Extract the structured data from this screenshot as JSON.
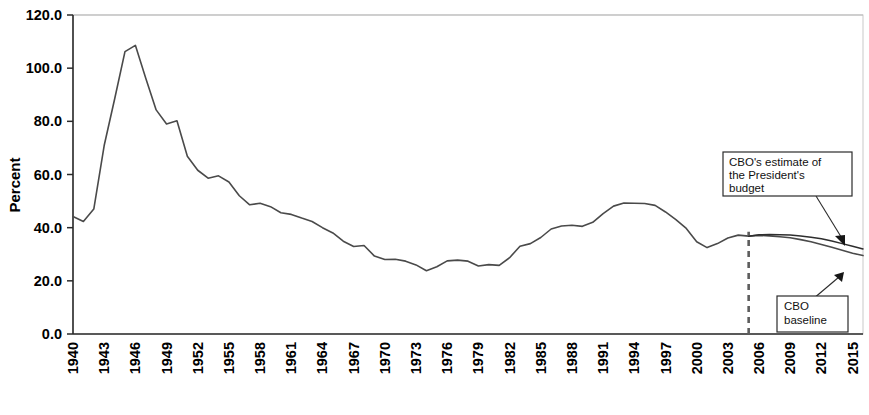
{
  "chart_data": {
    "type": "line",
    "title": "",
    "xlabel": "",
    "ylabel": "Percent",
    "ylim": [
      0.0,
      120.0
    ],
    "xlim": [
      1940,
      2016
    ],
    "yticks": [
      "0.0",
      "20.0",
      "40.0",
      "60.0",
      "80.0",
      "100.0",
      "120.0"
    ],
    "ytick_values": [
      0.0,
      20.0,
      40.0,
      60.0,
      80.0,
      100.0,
      120.0
    ],
    "xticks": [
      "1940",
      "1943",
      "1946",
      "1949",
      "1952",
      "1955",
      "1958",
      "1961",
      "1964",
      "1967",
      "1970",
      "1973",
      "1976",
      "1979",
      "1982",
      "1985",
      "1988",
      "1991",
      "1994",
      "1997",
      "2000",
      "2003",
      "2006",
      "2009",
      "2012",
      "2015"
    ],
    "xtick_values": [
      1940,
      1943,
      1946,
      1949,
      1952,
      1955,
      1958,
      1961,
      1964,
      1967,
      1970,
      1973,
      1976,
      1979,
      1982,
      1985,
      1988,
      1991,
      1994,
      1997,
      2000,
      2003,
      2006,
      2009,
      2012,
      2015
    ],
    "grid": false,
    "legend_position": "none",
    "projection_start_year": 2005,
    "series": [
      {
        "name": "Historical and CBO baseline",
        "color": "#4a4a4a",
        "x": [
          1940,
          1941,
          1942,
          1943,
          1944,
          1945,
          1946,
          1947,
          1948,
          1949,
          1950,
          1951,
          1952,
          1953,
          1954,
          1955,
          1956,
          1957,
          1958,
          1959,
          1960,
          1961,
          1962,
          1963,
          1964,
          1965,
          1966,
          1967,
          1968,
          1969,
          1970,
          1971,
          1972,
          1973,
          1974,
          1975,
          1976,
          1977,
          1978,
          1979,
          1980,
          1981,
          1982,
          1983,
          1984,
          1985,
          1986,
          1987,
          1988,
          1989,
          1990,
          1991,
          1992,
          1993,
          1994,
          1995,
          1996,
          1997,
          1998,
          1999,
          2000,
          2001,
          2002,
          2003,
          2004,
          2005,
          2006,
          2007,
          2008,
          2009,
          2010,
          2011,
          2012,
          2013,
          2014,
          2015,
          2016
        ],
        "y": [
          44.2,
          42.3,
          47.0,
          70.9,
          88.3,
          106.2,
          108.6,
          96.2,
          84.3,
          79.0,
          80.2,
          66.9,
          61.6,
          58.6,
          59.5,
          57.2,
          52.0,
          48.6,
          49.2,
          47.9,
          45.6,
          45.0,
          43.6,
          42.3,
          40.0,
          38.0,
          34.9,
          32.9,
          33.3,
          29.3,
          28.0,
          28.1,
          27.4,
          26.0,
          23.8,
          25.3,
          27.5,
          27.8,
          27.4,
          25.6,
          26.1,
          25.8,
          28.7,
          33.0,
          34.0,
          36.3,
          39.5,
          40.6,
          40.9,
          40.5,
          42.0,
          45.3,
          48.1,
          49.3,
          49.2,
          49.1,
          48.4,
          45.9,
          43.0,
          39.7,
          34.7,
          32.5,
          34.0,
          36.1,
          37.2,
          36.8,
          37.1,
          36.9,
          36.6,
          36.2,
          35.5,
          34.7,
          33.7,
          32.6,
          31.5,
          30.4,
          29.5
        ]
      },
      {
        "name": "CBO's estimate of the President's budget",
        "color": "#2e2e2e",
        "x": [
          2005,
          2006,
          2007,
          2008,
          2009,
          2010,
          2011,
          2012,
          2013,
          2014,
          2015,
          2016
        ],
        "y": [
          36.8,
          37.3,
          37.4,
          37.3,
          37.2,
          36.9,
          36.4,
          35.8,
          35.0,
          34.0,
          33.0,
          32.0
        ]
      }
    ],
    "annotations": [
      {
        "id": "presidents-budget",
        "text_lines": [
          "CBO's estimate of",
          "the President's",
          "budget"
        ],
        "target_year": 2011,
        "target_value": 36.0
      },
      {
        "id": "cbo-baseline",
        "text_lines": [
          "CBO",
          "baseline"
        ],
        "target_year": 2014,
        "target_value": 31.5
      }
    ]
  }
}
